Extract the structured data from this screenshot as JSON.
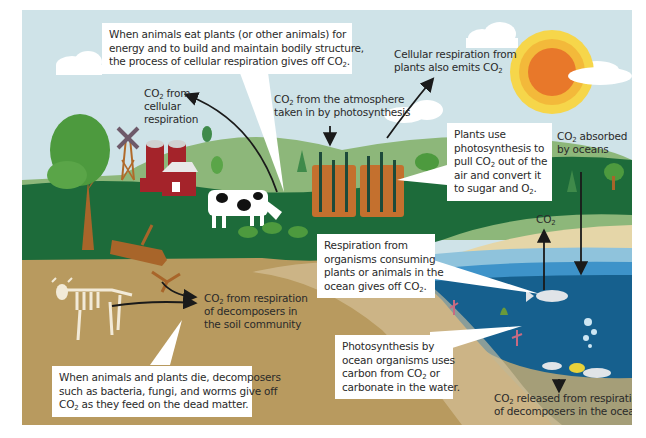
{
  "diagram": {
    "colors": {
      "sky": "#cfe3e8",
      "sun_outer": "#f6d64a",
      "sun_mid": "#f3b93a",
      "sun_core": "#e8782a",
      "grass_dark": "#1d6b3a",
      "hill_light": "#8db77a",
      "soil": "#b89a5f",
      "sand": "#e5d6a8",
      "ocean_surface": "#8fc3dc",
      "ocean_mid": "#3e93c9",
      "ocean_deep": "#16608e",
      "seabed": "#a59e78",
      "callout_bg": "#ffffff",
      "text": "#2a2a2a"
    },
    "callouts": {
      "animal_respiration": {
        "lines": [
          "When animals eat plants (or other animals) for",
          "energy and to build and maintain bodily structure,",
          "the process of cellular respiration gives off CO"
        ],
        "subscript": "2",
        "end": "."
      },
      "plant_photosynthesis": {
        "lines": [
          "Plants use",
          "photosynthesis to",
          "pull CO",
          " out of the",
          "air and convert it",
          "to sugar and O",
          "."
        ],
        "sub": "2"
      },
      "ocean_respiration": {
        "lines": [
          "Respiration from",
          "organisms consuming",
          "plants or animals in the",
          "ocean gives off CO"
        ],
        "sub": "2",
        "end": "."
      },
      "ocean_photosynthesis": {
        "lines": [
          "Photosynthesis by",
          "ocean organisms uses",
          "carbon from CO",
          " or",
          "carbonate in the water."
        ],
        "sub": "2"
      },
      "decomposers_land": {
        "lines": [
          "When animals and plants die, decomposers",
          "such as bacteria, fungi, and worms give off",
          "CO",
          " as they feed on the dead matter."
        ],
        "sub": "2"
      }
    },
    "labels": {
      "plant_respiration": {
        "lines": [
          "Cellular respiration from",
          "plants also emits CO"
        ],
        "sub": "2"
      },
      "cellular_respiration": {
        "co": "CO",
        "sub": "2",
        "lines": [
          " from",
          "cellular",
          "respiration"
        ]
      },
      "atmosphere_photosynthesis": {
        "co": "CO",
        "sub": "2",
        "lines": [
          " from the atmosphere",
          "taken in by photosynthesis"
        ]
      },
      "absorbed_by_oceans": {
        "co": "CO",
        "sub": "2",
        "lines": [
          " absorbed",
          "by oceans"
        ]
      },
      "ocean_co2": {
        "co": "CO",
        "sub": "2"
      },
      "soil_decomposers": {
        "co": "CO",
        "sub": "2",
        "lines": [
          " from respiration",
          "of decomposers in",
          "the soil community"
        ]
      },
      "ocean_decomposers": {
        "co": "CO",
        "sub": "2",
        "lines": [
          " released from respiration",
          "of decomposers in the ocean"
        ]
      }
    },
    "icons": [
      "sun-icon",
      "cloud-icon",
      "tree-icon",
      "windmill-icon",
      "barn-icon",
      "silo-icon",
      "cow-icon",
      "crop-field-icon",
      "log-icon",
      "skeleton-icon",
      "root-icon",
      "fish-icon",
      "coral-icon",
      "bubbles-icon",
      "arrow-icon"
    ]
  }
}
